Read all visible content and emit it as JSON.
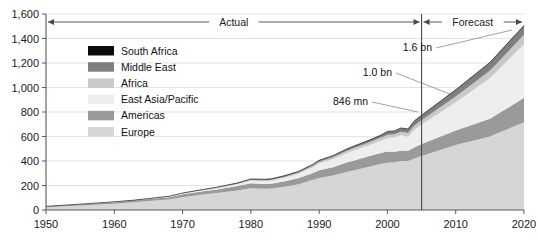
{
  "chart_data": {
    "type": "area",
    "stacked": true,
    "title": "",
    "subtitle": "",
    "xlabel": "",
    "ylabel": "",
    "xlim": [
      1950,
      2020
    ],
    "ylim": [
      0,
      1600
    ],
    "grid": true,
    "legend_position": "inside-top-left",
    "x_ticks": [
      "1950",
      "1960",
      "1970",
      "1980",
      "1990",
      "2000",
      "2010",
      "2020"
    ],
    "y_ticks": [
      "0",
      "200",
      "400",
      "600",
      "800",
      "1,000",
      "1,200",
      "1,400",
      "1,600"
    ],
    "x": [
      1950,
      1955,
      1960,
      1963,
      1965,
      1968,
      1970,
      1973,
      1975,
      1978,
      1980,
      1982,
      1983,
      1985,
      1987,
      1989,
      1990,
      1992,
      1994,
      1995,
      1997,
      1999,
      2000,
      2001,
      2002,
      2003,
      2004,
      2005,
      2010,
      2015,
      2020
    ],
    "series": [
      {
        "name": "Europe",
        "color": "#d6d6d6",
        "values": [
          22,
          36,
          52,
          63,
          73,
          86,
          105,
          126,
          138,
          160,
          178,
          174,
          175,
          190,
          211,
          244,
          262,
          282,
          310,
          322,
          350,
          376,
          386,
          389,
          399,
          401,
          421,
          441,
          530,
          600,
          717
        ]
      },
      {
        "name": "Americas",
        "color": "#9a9a9a",
        "values": [
          7,
          10,
          12,
          14,
          16,
          19,
          23,
          27,
          30,
          36,
          40,
          39,
          40,
          45,
          50,
          57,
          62,
          67,
          77,
          80,
          85,
          90,
          92,
          87,
          85,
          83,
          92,
          98,
          120,
          145,
          199
        ]
      },
      {
        "name": "East Asia/Pacific",
        "color": "#eeeeee",
        "values": [
          0.2,
          0.5,
          1,
          1.5,
          2,
          3,
          6,
          8,
          10,
          14,
          21,
          22,
          23,
          28,
          35,
          46,
          55,
          65,
          77,
          82,
          88,
          98,
          110,
          115,
          126,
          114,
          145,
          156,
          230,
          330,
          438
        ]
      },
      {
        "name": "Africa",
        "color": "#c9c9c9",
        "values": [
          0.5,
          0.8,
          1,
          1.3,
          1.5,
          2,
          2.4,
          3.2,
          3.8,
          4.8,
          7,
          7.5,
          8,
          9,
          10,
          13,
          15,
          17,
          18,
          20,
          22,
          25,
          27,
          28,
          29,
          30,
          33,
          37,
          47,
          61,
          77
        ]
      },
      {
        "name": "Middle East",
        "color": "#7f7f7f",
        "values": [
          0.2,
          0.3,
          0.6,
          0.8,
          1,
          1.5,
          1.9,
          2.8,
          3.5,
          4.5,
          7,
          7.5,
          7.8,
          8,
          8.5,
          9,
          10,
          11,
          13,
          14,
          15,
          18,
          24,
          23,
          28,
          30,
          36,
          38,
          50,
          63,
          69
        ]
      },
      {
        "name": "South Africa",
        "color": "#0a0a0a",
        "values": [
          0.1,
          0.1,
          0.2,
          0.2,
          0.3,
          0.3,
          0.4,
          0.5,
          0.5,
          0.6,
          0.8,
          0.8,
          0.9,
          1,
          1.1,
          1.3,
          1.5,
          1.7,
          2,
          2.1,
          2.3,
          2.5,
          2.7,
          2.8,
          2.9,
          3,
          3.2,
          3.4,
          4,
          5,
          6
        ]
      }
    ],
    "annotations": [
      {
        "text": "846 mn",
        "x": 2005,
        "y": 846
      },
      {
        "text": "1.0 bn",
        "x": 2010,
        "y": 1000
      },
      {
        "text": "1.6 bn",
        "x": 2020,
        "y": 1600
      }
    ],
    "phases": [
      {
        "label": "Actual",
        "from": 1950,
        "to": 2005
      },
      {
        "label": "Forecast",
        "from": 2005,
        "to": 2020
      }
    ],
    "divider_year": 2005
  },
  "legend": {
    "items": [
      {
        "label": "South Africa",
        "color": "#0a0a0a"
      },
      {
        "label": "Middle East",
        "color": "#7f7f7f"
      },
      {
        "label": "Africa",
        "color": "#c9c9c9"
      },
      {
        "label": "East Asia/Pacific",
        "color": "#eeeeee"
      },
      {
        "label": "Americas",
        "color": "#9a9a9a"
      },
      {
        "label": "Europe",
        "color": "#d6d6d6"
      }
    ]
  },
  "colors": {
    "background": "#ffffff",
    "axis": "#5a5a5a",
    "grid": "#d8d8d8",
    "text": "#111111",
    "divider": "#4a4a4a"
  }
}
